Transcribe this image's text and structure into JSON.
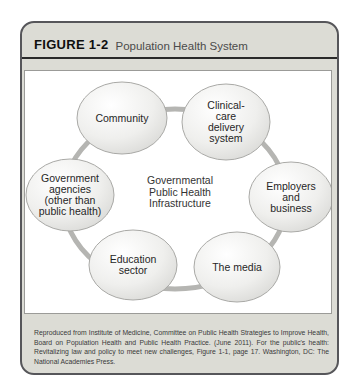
{
  "figure": {
    "label": "FIGURE 1-2",
    "title": "Population Health System"
  },
  "diagram": {
    "center": "Governmental\nPublic Health\nInfrastructure",
    "nodes": [
      {
        "id": "community",
        "label": "Community"
      },
      {
        "id": "clinical-care-delivery-system",
        "label": "Clinical-\ncare\ndelivery\nsystem"
      },
      {
        "id": "government-agencies",
        "label": "Government\nagencies\n(other than\npublic health)"
      },
      {
        "id": "employers-and-business",
        "label": "Employers\nand business"
      },
      {
        "id": "education-sector",
        "label": "Education\nsector"
      },
      {
        "id": "the-media",
        "label": "The media"
      }
    ]
  },
  "caption": "Reproduced from Institute of Medicine, Committee on Public Health Strategies to Improve Health, Board on Population Health and Public Health Practice. (June 2011). For the public's health: Revitalizing law and policy to meet new challenges, Figure 1-1, page 17. Washington, DC: The National Academies Press.",
  "colors": {
    "card_background": "#dcdcd5",
    "connector_ring": "#b5b5b2",
    "node_border": "#a9a9a6",
    "node_fill_edge": "#d3d3d0"
  }
}
